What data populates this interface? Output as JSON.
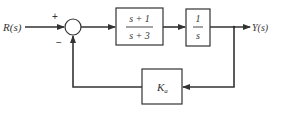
{
  "diagram": {
    "type": "block-diagram",
    "input": {
      "label": "R(s)"
    },
    "output": {
      "label": "Y(s)"
    },
    "summing_junction": {
      "plus_sign": "+",
      "minus_sign": "−"
    },
    "forward_blocks": [
      {
        "numerator": "s + 1",
        "denominator": "s + 3"
      },
      {
        "numerator": "1",
        "denominator": "s"
      }
    ],
    "feedback_block": {
      "label": "K",
      "subscript": "a"
    },
    "colors": {
      "line": "#333333",
      "box_fill": "#ffffff",
      "background": "#ffffff"
    }
  }
}
